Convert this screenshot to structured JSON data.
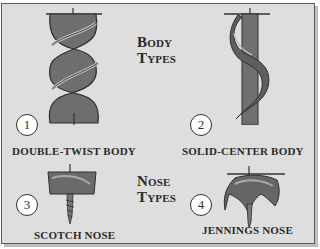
{
  "figure": {
    "headings": {
      "body_types": [
        "Body",
        "Types"
      ],
      "nose_types": [
        "Nose",
        "Types"
      ]
    },
    "items": [
      {
        "number": "1",
        "label": "DOUBLE-TWIST BODY",
        "icon": "double-twist-auger-bit"
      },
      {
        "number": "2",
        "label": "SOLID-CENTER BODY",
        "icon": "solid-center-auger-bit"
      },
      {
        "number": "3",
        "label": "SCOTCH NOSE",
        "icon": "scotch-nose-bit"
      },
      {
        "number": "4",
        "label": "JENNINGS NOSE",
        "icon": "jennings-nose-bit"
      }
    ],
    "colors": {
      "background": "#dedede",
      "border": "#5a5a5a",
      "metal": "#6e6e6e",
      "text": "#2b2b2b"
    }
  }
}
